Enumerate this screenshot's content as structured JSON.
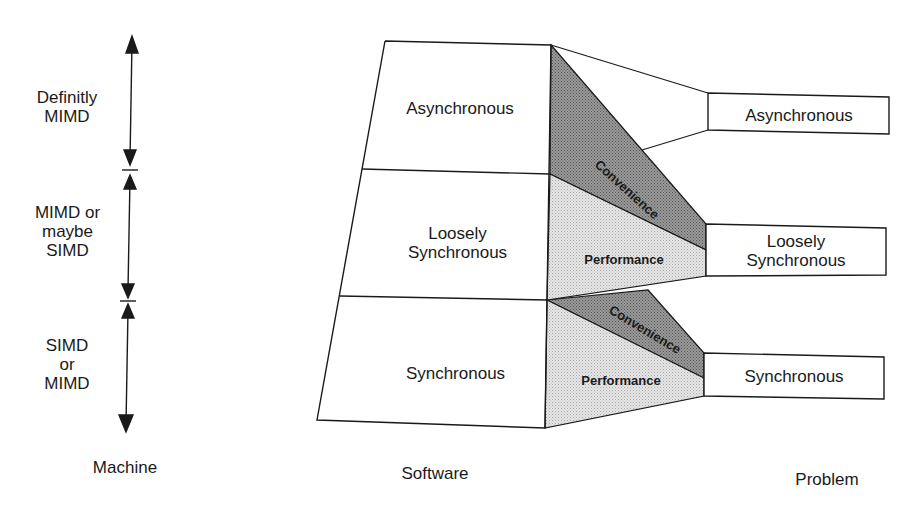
{
  "diagram": {
    "type": "mapping-diagram",
    "columns": {
      "machine": {
        "title": "Machine"
      },
      "software": {
        "title": "Software"
      },
      "problem": {
        "title": "Problem"
      }
    },
    "machine_ranges": [
      {
        "line1": "Definitly",
        "line2": "MIMD",
        "line3": ""
      },
      {
        "line1": "MIMD or",
        "line2": "maybe",
        "line3": "SIMD"
      },
      {
        "line1": "SIMD",
        "line2": "or",
        "line3": "MIMD"
      }
    ],
    "software_levels": [
      {
        "line1": "Asynchronous",
        "line2": ""
      },
      {
        "line1": "Loosely",
        "line2": "Synchronous"
      },
      {
        "line1": "Synchronous",
        "line2": ""
      }
    ],
    "problem_levels": [
      {
        "line1": "Asynchronous",
        "line2": ""
      },
      {
        "line1": "Loosely",
        "line2": "Synchronous"
      },
      {
        "line1": "Synchronous",
        "line2": ""
      }
    ],
    "mapping_regions": {
      "convenience_label": "Convenience",
      "performance_label": "Performance"
    },
    "colors": {
      "line": "#1a1a1a",
      "convenience_fill": "#8a8a8a",
      "performance_fill": "#d9d9d9",
      "background": "#ffffff"
    }
  }
}
